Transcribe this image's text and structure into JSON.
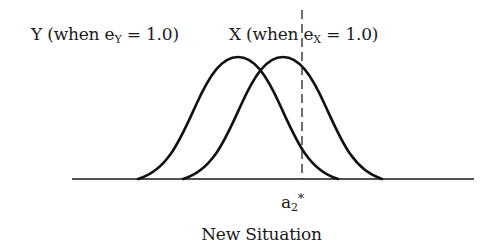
{
  "diagram": {
    "caption": "New Situation",
    "labels": {
      "y_curve": {
        "prefix": "Y (when e",
        "subscript": "Y",
        "suffix": " = 1.0)"
      },
      "x_curve": {
        "prefix": "X (when e",
        "subscript": "X",
        "suffix": " = 1.0)"
      },
      "threshold": {
        "base": "a",
        "subscript": "2",
        "superscript": "*"
      }
    },
    "curves": [
      {
        "name": "Y distribution",
        "start_x": 138,
        "peak_x": 238,
        "end_x": 338
      },
      {
        "name": "X distribution",
        "start_x": 183,
        "peak_x": 283,
        "end_x": 382
      }
    ],
    "threshold_line": {
      "x": 302,
      "style": "dashed"
    },
    "baseline": {
      "x1": 72,
      "x2": 474,
      "y": 179
    },
    "colors": {
      "stroke": "#111111",
      "background": "#ffffff"
    }
  }
}
